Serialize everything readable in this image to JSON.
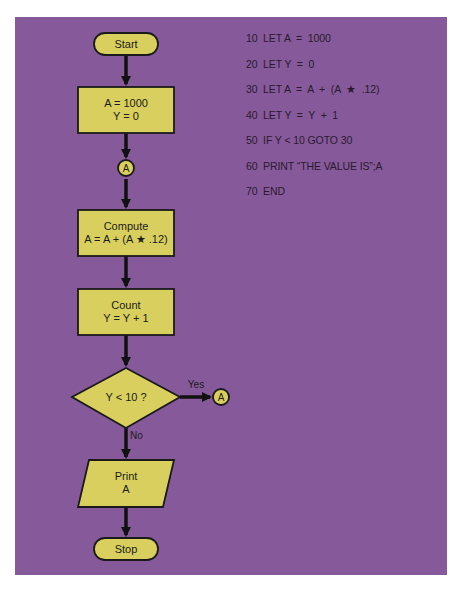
{
  "flowchart": {
    "start_label": "Start",
    "init_line1": "A = 1000",
    "init_line2": "Y = 0",
    "connector_label": "A",
    "compute_line1": "Compute",
    "compute_line2": "A = A + (A ★ .12)",
    "count_line1": "Count",
    "count_line2": "Y = Y + 1",
    "decision_label": "Y < 10 ?",
    "yes_label": "Yes",
    "yes_connector_label": "A",
    "no_label": "No",
    "print_line1": "Print",
    "print_line2": "A",
    "stop_label": "Stop"
  },
  "program": {
    "lines": [
      "10  LET A  =  1000",
      "20  LET Y  =  0",
      "30  LET A  =  A  +  (A  ★  .12)",
      "40  LET Y  =  Y  +  1",
      "50  IF Y < 10 GOTO 30",
      "60  PRINT “THE VALUE IS”;A",
      "70  END"
    ]
  },
  "colors": {
    "background": "#86599a",
    "shape_fill": "#d9cf5e",
    "stroke": "#1a1a1a"
  }
}
